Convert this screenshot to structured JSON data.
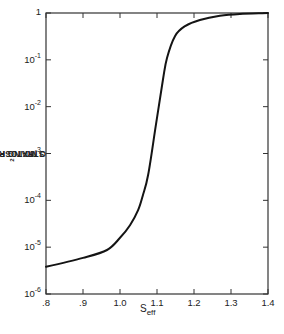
{
  "chart_data": {
    "type": "line",
    "title": "",
    "xlabel": "S_eff",
    "xlabel_main": "S",
    "xlabel_sub": "eff",
    "ylabel": "STRATOSPHERIC H2O MIXING RATIO, v/v",
    "ylabel_parts": [
      "STRATOSPHERIC H",
      "2",
      "O MIXING RATIO, v/v"
    ],
    "yscale": "log",
    "xlim": [
      0.8,
      1.4
    ],
    "ylim": [
      1e-06,
      1
    ],
    "grid": false,
    "legend": null,
    "x_ticks": [
      {
        "value": 0.8,
        "label": ".8"
      },
      {
        "value": 0.9,
        "label": ".9"
      },
      {
        "value": 1.0,
        "label": "1.0"
      },
      {
        "value": 1.1,
        "label": "1.1"
      },
      {
        "value": 1.2,
        "label": "1.2"
      },
      {
        "value": 1.3,
        "label": "1.3"
      },
      {
        "value": 1.4,
        "label": "1.4"
      }
    ],
    "y_ticks": [
      {
        "exp": 0,
        "base": "1",
        "sup": ""
      },
      {
        "exp": -1,
        "base": "10",
        "sup": "-1"
      },
      {
        "exp": -2,
        "base": "10",
        "sup": "-2"
      },
      {
        "exp": -3,
        "base": "10",
        "sup": "-3"
      },
      {
        "exp": -4,
        "base": "10",
        "sup": "-4"
      },
      {
        "exp": -5,
        "base": "10",
        "sup": "-5"
      },
      {
        "exp": -6,
        "base": "10",
        "sup": "-6"
      }
    ],
    "series": [
      {
        "name": "H2O mixing ratio",
        "x": [
          0.8,
          0.9,
          0.965,
          1.0,
          1.027,
          1.049,
          1.062,
          1.076,
          1.095,
          1.116,
          1.127,
          1.149,
          1.176,
          1.216,
          1.27,
          1.324,
          1.4
        ],
        "log10y": [
          -5.42,
          -5.23,
          -5.06,
          -4.8,
          -4.53,
          -4.21,
          -3.89,
          -3.46,
          -2.5,
          -1.43,
          -0.96,
          -0.49,
          -0.28,
          -0.15,
          -0.06,
          -0.02,
          0.0
        ],
        "values": [
          3.8e-06,
          5.9e-06,
          8.7e-06,
          1.6e-05,
          3e-05,
          6.2e-05,
          0.00013,
          0.00035,
          0.0032,
          0.037,
          0.11,
          0.32,
          0.52,
          0.71,
          0.87,
          0.95,
          1.0
        ]
      }
    ]
  },
  "style": {
    "line_color": "#141414",
    "axis_color": "#333333",
    "background": "#ffffff"
  }
}
